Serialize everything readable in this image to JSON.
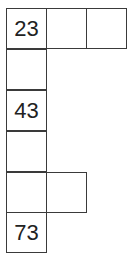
{
  "puzzle": {
    "cells": [
      {
        "row": 0,
        "col": 0,
        "value": "23"
      },
      {
        "row": 0,
        "col": 1,
        "value": ""
      },
      {
        "row": 0,
        "col": 2,
        "value": ""
      },
      {
        "row": 1,
        "col": 0,
        "value": ""
      },
      {
        "row": 2,
        "col": 0,
        "value": "43"
      },
      {
        "row": 3,
        "col": 0,
        "value": ""
      },
      {
        "row": 4,
        "col": 0,
        "value": ""
      },
      {
        "row": 4,
        "col": 1,
        "value": ""
      },
      {
        "row": 5,
        "col": 0,
        "value": "73"
      }
    ]
  }
}
